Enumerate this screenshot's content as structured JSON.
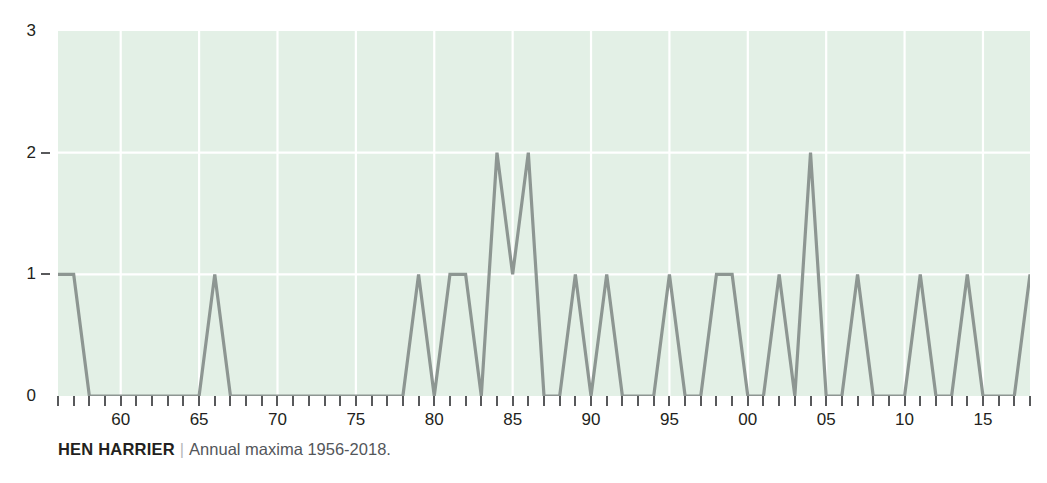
{
  "caption": {
    "species": "HEN HARRIER",
    "separator": "|",
    "description": "Annual maxima 1956-2018."
  },
  "colors": {
    "plot_background": "#e3f0e6",
    "gridline": "#ffffff",
    "series_line": "#8d9692",
    "axis_text": "#231f20",
    "tick_mark": "#58595b"
  },
  "chart_data": {
    "type": "line",
    "title": "HEN HARRIER",
    "subtitle": "Annual maxima 1956-2018.",
    "xlabel": "",
    "ylabel": "",
    "ylim": [
      0,
      3
    ],
    "xlim": [
      1956,
      2018
    ],
    "grid": true,
    "legend": false,
    "y_ticks": [
      0,
      1,
      2,
      3
    ],
    "y_tick_labels": [
      "0",
      "1",
      "2",
      "3"
    ],
    "x_major_ticks": [
      1960,
      1965,
      1970,
      1975,
      1980,
      1985,
      1990,
      1995,
      2000,
      2005,
      2010,
      2015
    ],
    "x_major_tick_labels": [
      "60",
      "65",
      "70",
      "75",
      "80",
      "85",
      "90",
      "95",
      "00",
      "05",
      "10",
      "15"
    ],
    "x": [
      1956,
      1957,
      1958,
      1959,
      1960,
      1961,
      1962,
      1963,
      1964,
      1965,
      1966,
      1967,
      1968,
      1969,
      1970,
      1971,
      1972,
      1973,
      1974,
      1975,
      1976,
      1977,
      1978,
      1979,
      1980,
      1981,
      1982,
      1983,
      1984,
      1985,
      1986,
      1987,
      1988,
      1989,
      1990,
      1991,
      1992,
      1993,
      1994,
      1995,
      1996,
      1997,
      1998,
      1999,
      2000,
      2001,
      2002,
      2003,
      2004,
      2005,
      2006,
      2007,
      2008,
      2009,
      2010,
      2011,
      2012,
      2013,
      2014,
      2015,
      2016,
      2017,
      2018
    ],
    "values": [
      1,
      1,
      0,
      0,
      0,
      0,
      0,
      0,
      0,
      0,
      1,
      0,
      0,
      0,
      0,
      0,
      0,
      0,
      0,
      0,
      0,
      0,
      0,
      1,
      0,
      1,
      1,
      0,
      2,
      1,
      2,
      0,
      0,
      1,
      0,
      1,
      0,
      0,
      0,
      1,
      0,
      0,
      1,
      1,
      0,
      0,
      1,
      0,
      2,
      0,
      0,
      1,
      0,
      0,
      0,
      1,
      0,
      0,
      1,
      0,
      0,
      0,
      1
    ],
    "series": [
      {
        "name": "Annual maxima",
        "values": [
          1,
          1,
          0,
          0,
          0,
          0,
          0,
          0,
          0,
          0,
          1,
          0,
          0,
          0,
          0,
          0,
          0,
          0,
          0,
          0,
          0,
          0,
          0,
          1,
          0,
          1,
          1,
          0,
          2,
          1,
          2,
          0,
          0,
          1,
          0,
          1,
          0,
          0,
          0,
          1,
          0,
          0,
          1,
          1,
          0,
          0,
          1,
          0,
          2,
          0,
          0,
          1,
          0,
          0,
          0,
          1,
          0,
          0,
          1,
          0,
          0,
          0,
          1
        ]
      }
    ]
  }
}
